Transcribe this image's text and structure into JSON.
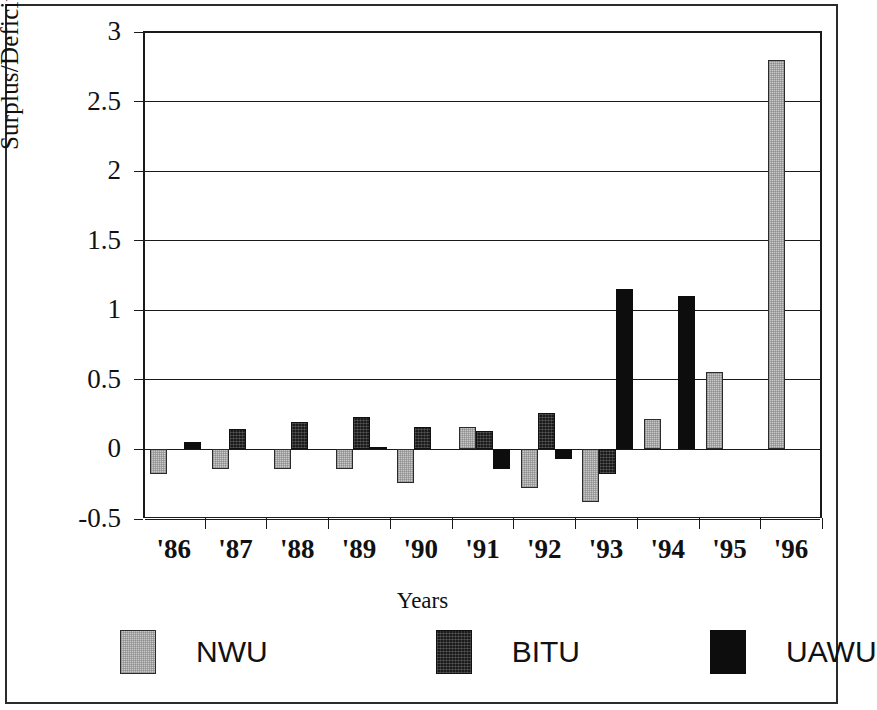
{
  "chart_data": {
    "type": "bar",
    "title": "",
    "subtitle": "",
    "xlabel": "Years",
    "ylabel": "Surplus/Deficit ($m)",
    "categories": [
      "'86",
      "'87",
      "'88",
      "'89",
      "'90",
      "'91",
      "'92",
      "'93",
      "'94",
      "'95",
      "'96"
    ],
    "ylim": [
      -0.5,
      3
    ],
    "ytick_labels": [
      "3",
      "2.5",
      "2",
      "1.5",
      "1",
      "0.5",
      "0",
      "-0.5"
    ],
    "ytick_values": [
      3,
      2.5,
      2,
      1.5,
      1,
      0.5,
      0,
      -0.5
    ],
    "grid": true,
    "legend_position": "bottom",
    "series": [
      {
        "name": "NWU",
        "color": "#c9c9c9",
        "values": [
          -0.18,
          -0.14,
          -0.14,
          -0.14,
          -0.24,
          0.16,
          -0.28,
          -0.38,
          0.22,
          0.56,
          2.8
        ]
      },
      {
        "name": "BITU",
        "color": "#1b1b1b",
        "values": [
          null,
          0.15,
          0.2,
          0.23,
          0.16,
          0.13,
          0.26,
          -0.18,
          null,
          null,
          null
        ]
      },
      {
        "name": "UAWU",
        "color": "#0d0d0d",
        "values": [
          0.05,
          null,
          null,
          0.02,
          null,
          -0.14,
          -0.07,
          1.15,
          1.1,
          null,
          null
        ]
      }
    ]
  },
  "axes": {
    "y_title": "Surplus/Deficit ($m)",
    "x_title": "Years"
  },
  "legend": {
    "items": [
      {
        "label": "NWU",
        "swatch": "light-gray-hatch-swatch"
      },
      {
        "label": "BITU",
        "swatch": "dark-textured-swatch"
      },
      {
        "label": "UAWU",
        "swatch": "solid-black-swatch"
      }
    ]
  }
}
